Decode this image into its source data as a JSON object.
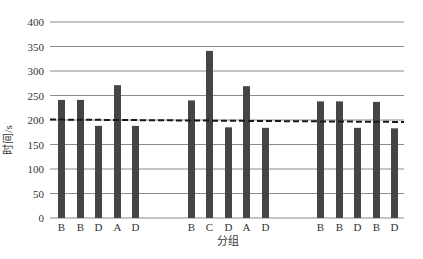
{
  "chart_data": {
    "type": "bar",
    "title": "",
    "xlabel": "分组",
    "ylabel": "时间/s",
    "ylim": [
      0,
      400
    ],
    "yticks": [
      0,
      50,
      100,
      150,
      200,
      250,
      300,
      350,
      400
    ],
    "grid": true,
    "legend": null,
    "groups": [
      {
        "categories": [
          "B",
          "B",
          "D",
          "A",
          "D"
        ],
        "values": [
          241,
          241,
          188,
          271,
          188
        ]
      },
      {
        "categories": [
          "B",
          "C",
          "D",
          "A",
          "D"
        ],
        "values": [
          240,
          341,
          185,
          269,
          184
        ]
      },
      {
        "categories": [
          "B",
          "B",
          "D",
          "B",
          "D"
        ],
        "values": [
          238,
          238,
          184,
          237,
          183
        ]
      }
    ],
    "categories": [
      "B",
      "B",
      "D",
      "A",
      "D",
      "B",
      "C",
      "D",
      "A",
      "D",
      "B",
      "B",
      "D",
      "B",
      "D"
    ],
    "values": [
      241,
      241,
      188,
      271,
      188,
      240,
      341,
      185,
      269,
      184,
      238,
      238,
      184,
      237,
      183
    ],
    "reference_line": {
      "style": "dashed",
      "start_value": 201,
      "end_value": 196
    },
    "colors": {
      "bar": "#454545",
      "grid": "#8a8a8a",
      "ref_line": "#1a1a1a"
    }
  }
}
